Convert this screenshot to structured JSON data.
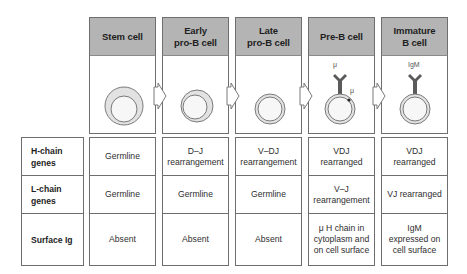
{
  "stages": [
    {
      "name": "Stem cell",
      "lines": [
        "Stem cell"
      ],
      "receptor": null,
      "receptor_label": null
    },
    {
      "name": "Early pro-B cell",
      "lines": [
        "Early",
        "pro-B cell"
      ],
      "receptor": null,
      "receptor_label": null
    },
    {
      "name": "Late pro-B cell",
      "lines": [
        "Late",
        "pro-B cell"
      ],
      "receptor": null,
      "receptor_label": null
    },
    {
      "name": "Pre-B cell",
      "lines": [
        "Pre-B cell"
      ],
      "receptor": "mu-receptor",
      "receptor_label": "μ",
      "cytoplasm_label": "μ"
    },
    {
      "name": "Immature B cell",
      "lines": [
        "Immature",
        "B cell"
      ],
      "receptor": "igm-receptor",
      "receptor_label": "IgM"
    }
  ],
  "rows": [
    {
      "label": [
        "H-chain",
        "genes"
      ],
      "values": [
        [
          "Germline"
        ],
        [
          "D–J",
          "rearrangement"
        ],
        [
          "V–DJ",
          "rearrangement"
        ],
        [
          "VDJ",
          "rearranged"
        ],
        [
          "VDJ",
          "rearranged"
        ]
      ]
    },
    {
      "label": [
        "L-chain",
        "genes"
      ],
      "values": [
        [
          "Germline"
        ],
        [
          "Germline"
        ],
        [
          "Germline"
        ],
        [
          "V–J",
          "rearrangement"
        ],
        [
          "VJ rearranged"
        ]
      ]
    },
    {
      "label": [
        "Surface Ig"
      ],
      "values": [
        [
          "Absent"
        ],
        [
          "Absent"
        ],
        [
          "Absent"
        ],
        [
          "μ H chain in",
          "cytoplasm and",
          "on cell surface"
        ],
        [
          "IgM",
          "expressed on",
          "cell surface"
        ]
      ]
    }
  ],
  "colors": {
    "header_fill": "#b4b4b4",
    "border": "#6e6e6e",
    "cell_outline": "#7a7a7a",
    "cell_fill": "#e4e4e4",
    "receptor": "#5a5a5a"
  }
}
